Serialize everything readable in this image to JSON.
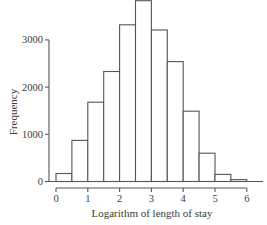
{
  "chart_data": {
    "type": "bar",
    "subtype": "histogram",
    "title": "",
    "xlabel": "Logarithm of length of stay",
    "ylabel": "Frequency",
    "bin_width": 0.5,
    "bins": [
      {
        "start": 0.0,
        "end": 0.5,
        "value": 170
      },
      {
        "start": 0.5,
        "end": 1.0,
        "value": 870
      },
      {
        "start": 1.0,
        "end": 1.5,
        "value": 1680
      },
      {
        "start": 1.5,
        "end": 2.0,
        "value": 2330
      },
      {
        "start": 2.0,
        "end": 2.5,
        "value": 3320
      },
      {
        "start": 2.5,
        "end": 3.0,
        "value": 3830
      },
      {
        "start": 3.0,
        "end": 3.5,
        "value": 3210
      },
      {
        "start": 3.5,
        "end": 4.0,
        "value": 2540
      },
      {
        "start": 4.0,
        "end": 4.5,
        "value": 1490
      },
      {
        "start": 4.5,
        "end": 5.0,
        "value": 600
      },
      {
        "start": 5.0,
        "end": 5.5,
        "value": 150
      },
      {
        "start": 5.5,
        "end": 6.0,
        "value": 40
      }
    ],
    "categories": [
      "0-0.5",
      "0.5-1",
      "1-1.5",
      "1.5-2",
      "2-2.5",
      "2.5-3",
      "3-3.5",
      "3.5-4",
      "4-4.5",
      "4.5-5",
      "5-5.5",
      "5.5-6"
    ],
    "values": [
      170,
      870,
      1680,
      2330,
      3320,
      3830,
      3210,
      2540,
      1490,
      600,
      150,
      40
    ],
    "x_ticks": [
      "0",
      "1",
      "2",
      "3",
      "4",
      "5",
      "6"
    ],
    "y_ticks": [
      "0",
      "1000",
      "2000",
      "3000"
    ],
    "xlim": [
      0,
      6.5
    ],
    "ylim": [
      0,
      3850
    ],
    "grid": false,
    "legend": null,
    "colors": {
      "bar_fill": "#ffffff",
      "bar_stroke": "#555555",
      "axis": "#555555"
    }
  }
}
